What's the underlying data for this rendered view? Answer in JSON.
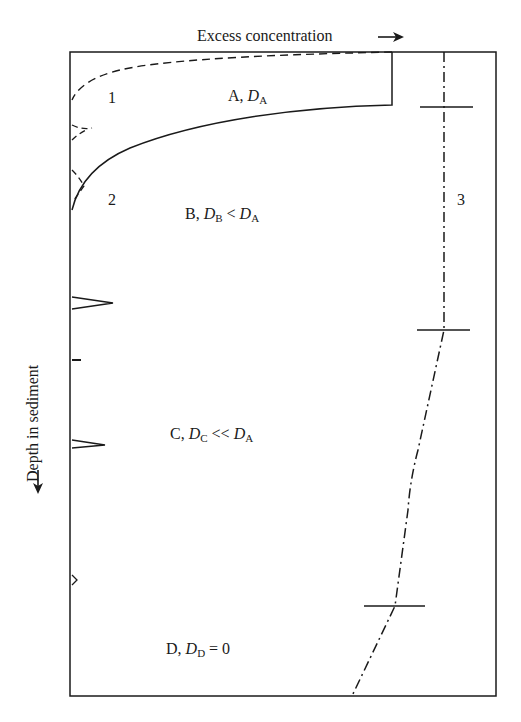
{
  "figure": {
    "x_axis_label": "Excess concentration",
    "y_axis_label": "Depth in sediment",
    "x_arrow": "→",
    "y_arrow": "←"
  },
  "zones": [
    {
      "id": "A",
      "letter": "A",
      "sym": "D",
      "sub": "A",
      "rel": ""
    },
    {
      "id": "B",
      "letter": "B",
      "sym": "D",
      "sub": "B",
      "rel": " < ",
      "ref_sym": "D",
      "ref_sub": "A"
    },
    {
      "id": "C",
      "letter": "C",
      "sym": "D",
      "sub": "C",
      "rel": " << ",
      "ref_sym": "D",
      "ref_sub": "A"
    },
    {
      "id": "D",
      "letter": "D",
      "sym": "D",
      "sub": "D",
      "rel": " = 0"
    }
  ],
  "curve_labels": [
    "1",
    "2",
    "3"
  ],
  "colors": {
    "line": "#1a1a1a",
    "background": "#ffffff"
  }
}
